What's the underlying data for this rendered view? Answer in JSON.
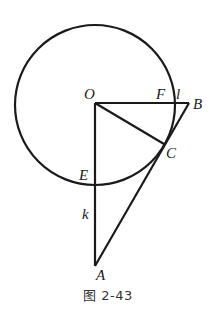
{
  "diagram": {
    "caption": "图 2-43",
    "stroke_color": "#1a1a1a",
    "circle": {
      "center": "O",
      "label": "circle O"
    },
    "points": {
      "O": {
        "label": "O"
      },
      "F": {
        "label": "F"
      },
      "B": {
        "label": "B"
      },
      "C": {
        "label": "C"
      },
      "E": {
        "label": "E"
      },
      "A": {
        "label": "A"
      }
    },
    "lines": {
      "l": {
        "label": "l"
      },
      "k": {
        "label": "k"
      }
    },
    "segments": [
      "OB",
      "OA",
      "OC",
      "AB"
    ]
  }
}
